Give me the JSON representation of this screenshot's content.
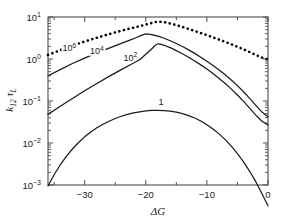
{
  "chart_data": {
    "type": "line",
    "title": "",
    "xlabel": "ΔG",
    "ylabel": "k12 τL",
    "ylabel_parts": {
      "k": "k",
      "sub": "12",
      "tau": "τ",
      "tausub": "L"
    },
    "xlim": [
      -36,
      0
    ],
    "ylim": [
      0.001,
      10
    ],
    "yscale": "log",
    "xscale": "linear",
    "grid": false,
    "legend": "inline-curve-labels",
    "xticks": [
      -30,
      -20,
      -10,
      0
    ],
    "xticklabels": [
      "−30",
      "−20",
      "−10",
      "0"
    ],
    "xminorticks": [
      -35,
      -25,
      -15,
      -5
    ],
    "yticks": [
      10,
      1,
      0.1,
      0.01,
      0.001
    ],
    "yticklabels": [
      "10¹",
      "10⁰",
      "10⁻¹",
      "10⁻²",
      "10⁻³"
    ],
    "ytick_mantissa": [
      "10",
      "10",
      "10",
      "10",
      "10"
    ],
    "ytick_exponent": [
      "1",
      "0",
      "-1",
      "-2",
      "-3"
    ],
    "series": [
      {
        "name": "10^6",
        "label": "10⁶",
        "label_mantissa": "10",
        "label_exponent": "6",
        "style": "dotted",
        "color": "#000000",
        "label_x": -32.5,
        "label_y": 1.55,
        "points": [
          [
            -36.0,
            1.25
          ],
          [
            -34.5,
            1.52
          ],
          [
            -33.0,
            1.85
          ],
          [
            -31.5,
            2.2
          ],
          [
            -30.0,
            2.6
          ],
          [
            -28.5,
            3.05
          ],
          [
            -27.0,
            3.55
          ],
          [
            -25.5,
            4.1
          ],
          [
            -24.0,
            4.7
          ],
          [
            -22.5,
            5.35
          ],
          [
            -21.0,
            6.05
          ],
          [
            -19.5,
            6.9
          ],
          [
            -18.5,
            7.55
          ],
          [
            -18.0,
            7.8
          ],
          [
            -17.0,
            7.55
          ],
          [
            -16.0,
            7.0
          ],
          [
            -15.0,
            6.4
          ],
          [
            -14.0,
            5.8
          ],
          [
            -13.0,
            5.2
          ],
          [
            -12.0,
            4.65
          ],
          [
            -11.0,
            4.15
          ],
          [
            -10.0,
            3.7
          ],
          [
            -9.0,
            3.28
          ],
          [
            -8.0,
            2.9
          ],
          [
            -7.0,
            2.56
          ],
          [
            -6.0,
            2.24
          ],
          [
            -5.0,
            1.96
          ],
          [
            -4.0,
            1.7
          ],
          [
            -3.0,
            1.46
          ],
          [
            -2.0,
            1.25
          ],
          [
            -1.0,
            1.08
          ],
          [
            0.0,
            0.98
          ]
        ]
      },
      {
        "name": "10^4",
        "label": "10⁴",
        "label_mantissa": "10",
        "label_exponent": "4",
        "style": "solid",
        "color": "#1a1a1a",
        "label_x": -28.0,
        "label_y": 1.3,
        "points": [
          [
            -36.0,
            0.4
          ],
          [
            -34.0,
            0.56
          ],
          [
            -32.0,
            0.78
          ],
          [
            -30.0,
            1.05
          ],
          [
            -28.0,
            1.4
          ],
          [
            -26.0,
            1.82
          ],
          [
            -24.0,
            2.35
          ],
          [
            -22.5,
            2.85
          ],
          [
            -21.5,
            3.25
          ],
          [
            -21.0,
            3.5
          ],
          [
            -20.5,
            3.75
          ],
          [
            -20.0,
            3.95
          ],
          [
            -19.0,
            3.8
          ],
          [
            -18.0,
            3.5
          ],
          [
            -17.0,
            3.12
          ],
          [
            -16.0,
            2.72
          ],
          [
            -15.0,
            2.34
          ],
          [
            -14.0,
            1.98
          ],
          [
            -13.0,
            1.65
          ],
          [
            -12.0,
            1.36
          ],
          [
            -11.0,
            1.1
          ],
          [
            -10.0,
            0.88
          ],
          [
            -9.0,
            0.7
          ],
          [
            -8.0,
            0.55
          ],
          [
            -7.0,
            0.42
          ],
          [
            -6.0,
            0.315
          ],
          [
            -5.0,
            0.232
          ],
          [
            -4.0,
            0.166
          ],
          [
            -3.0,
            0.115
          ],
          [
            -2.0,
            0.079
          ],
          [
            -1.0,
            0.055
          ],
          [
            0.0,
            0.042
          ]
        ]
      },
      {
        "name": "10^2",
        "label": "10²",
        "label_mantissa": "10",
        "label_exponent": "2",
        "style": "solid",
        "color": "#1a1a1a",
        "label_x": -22.5,
        "label_y": 0.92,
        "points": [
          [
            -36.0,
            0.048
          ],
          [
            -34.0,
            0.075
          ],
          [
            -32.0,
            0.115
          ],
          [
            -30.0,
            0.175
          ],
          [
            -28.0,
            0.262
          ],
          [
            -26.0,
            0.385
          ],
          [
            -24.0,
            0.56
          ],
          [
            -22.0,
            0.8
          ],
          [
            -21.0,
            0.96
          ],
          [
            -20.0,
            1.3
          ],
          [
            -19.0,
            1.75
          ],
          [
            -18.5,
            2.1
          ],
          [
            -18.0,
            2.3
          ],
          [
            -17.5,
            2.24
          ],
          [
            -17.0,
            2.12
          ],
          [
            -16.0,
            1.86
          ],
          [
            -15.0,
            1.58
          ],
          [
            -14.0,
            1.33
          ],
          [
            -13.0,
            1.1
          ],
          [
            -12.0,
            0.9
          ],
          [
            -11.0,
            0.725
          ],
          [
            -10.0,
            0.575
          ],
          [
            -9.0,
            0.45
          ],
          [
            -8.0,
            0.345
          ],
          [
            -7.0,
            0.26
          ],
          [
            -6.0,
            0.192
          ],
          [
            -5.0,
            0.139
          ],
          [
            -4.0,
            0.098
          ],
          [
            -3.0,
            0.0675
          ],
          [
            -2.0,
            0.046
          ],
          [
            -1.0,
            0.033
          ],
          [
            0.0,
            0.027
          ]
        ]
      },
      {
        "name": "1",
        "label": "1",
        "label_mantissa": "1",
        "label_exponent": "",
        "style": "solid",
        "color": "#1a1a1a",
        "label_x": -17.5,
        "label_y": 0.082,
        "points": [
          [
            -36.0,
            0.00095
          ],
          [
            -35.0,
            0.00175
          ],
          [
            -34.0,
            0.003
          ],
          [
            -33.0,
            0.0048
          ],
          [
            -32.0,
            0.0072
          ],
          [
            -31.0,
            0.0103
          ],
          [
            -30.0,
            0.014
          ],
          [
            -29.0,
            0.0183
          ],
          [
            -28.0,
            0.023
          ],
          [
            -27.0,
            0.028
          ],
          [
            -26.0,
            0.033
          ],
          [
            -25.0,
            0.0383
          ],
          [
            -24.0,
            0.0433
          ],
          [
            -23.0,
            0.048
          ],
          [
            -22.0,
            0.052
          ],
          [
            -21.0,
            0.0553
          ],
          [
            -20.0,
            0.058
          ],
          [
            -19.0,
            0.0596
          ],
          [
            -18.0,
            0.06
          ],
          [
            -17.0,
            0.0593
          ],
          [
            -16.0,
            0.0573
          ],
          [
            -15.0,
            0.0542
          ],
          [
            -14.0,
            0.05
          ],
          [
            -13.0,
            0.045
          ],
          [
            -12.0,
            0.0393
          ],
          [
            -11.0,
            0.0333
          ],
          [
            -10.0,
            0.0273
          ],
          [
            -9.0,
            0.0216
          ],
          [
            -8.0,
            0.0165
          ],
          [
            -7.0,
            0.012
          ],
          [
            -6.0,
            0.0084
          ],
          [
            -5.0,
            0.0056
          ],
          [
            -4.0,
            0.00355
          ],
          [
            -3.0,
            0.00212
          ],
          [
            -2.0,
            0.0012
          ],
          [
            -1.0,
            0.00063
          ],
          [
            0.0,
            0.00032
          ]
        ]
      }
    ]
  },
  "figure": {
    "background": "#ffffff",
    "axis_color": "#4d4d4d",
    "text_color": "#1a1a1a"
  }
}
